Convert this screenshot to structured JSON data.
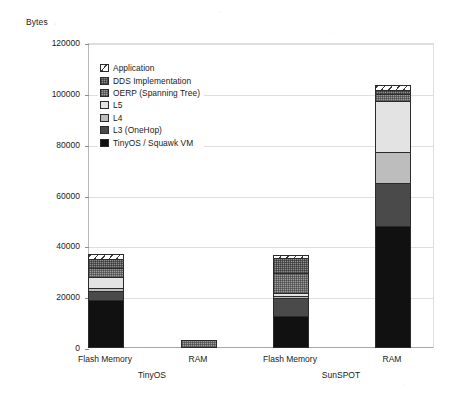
{
  "chart_data": {
    "type": "bar",
    "title": "",
    "subtitle": "",
    "xlabel": "",
    "ylabel": "Bytes",
    "stacked": true,
    "grid": true,
    "legend_position": "inside-top-left",
    "ylim": [
      0,
      120000
    ],
    "yticks": [
      0,
      20000,
      40000,
      60000,
      80000,
      100000,
      120000
    ],
    "ytick_labels": [
      "0",
      "20000",
      "40000",
      "60000",
      "80000",
      "100000",
      "120000"
    ],
    "categories": [
      "Flash Memory",
      "RAM",
      "Flash Memory",
      "RAM"
    ],
    "groups": [
      {
        "label": "TinyOS",
        "categories": [
          "Flash Memory",
          "RAM"
        ]
      },
      {
        "label": "SunSPOT",
        "categories": [
          "Flash Memory",
          "RAM"
        ]
      }
    ],
    "series": [
      {
        "name": "TinyOS / Squawk VM",
        "fill": "f-vm",
        "color": "#111111",
        "values": [
          19000,
          0,
          12500,
          48000
        ]
      },
      {
        "name": "L3 (OneHop)",
        "fill": "f-l3",
        "color": "#4a4a4a",
        "values": [
          3500,
          0,
          7000,
          17000
        ]
      },
      {
        "name": "L4",
        "fill": "f-l4",
        "color": "#bdbdbd",
        "values": [
          1000,
          0,
          1000,
          12000
        ]
      },
      {
        "name": "L5",
        "fill": "f-l5",
        "color": "#e3e3e3",
        "values": [
          4500,
          0,
          1000,
          20000
        ]
      },
      {
        "name": "OERP (Spanning Tree)",
        "fill": "f-oerp",
        "color": "#9c9c9c",
        "values": [
          3500,
          3000,
          8000,
          3000
        ]
      },
      {
        "name": "DDS Implementation",
        "fill": "f-dds",
        "color": "#8e8e8e",
        "values": [
          3500,
          0,
          6000,
          1500
        ]
      },
      {
        "name": "Application",
        "fill": "f-app",
        "color": "#ffffff",
        "values": [
          2000,
          0,
          1000,
          2000
        ]
      }
    ],
    "totals": [
      37000,
      3000,
      36500,
      103500
    ]
  },
  "legend": {
    "items": [
      {
        "label": "Application"
      },
      {
        "label": "DDS Implementation"
      },
      {
        "label": "OERP (Spanning Tree)"
      },
      {
        "label": "L5"
      },
      {
        "label": "L4"
      },
      {
        "label": "L3 (OneHop)"
      },
      {
        "label": "TinyOS / Squawk VM"
      }
    ]
  }
}
